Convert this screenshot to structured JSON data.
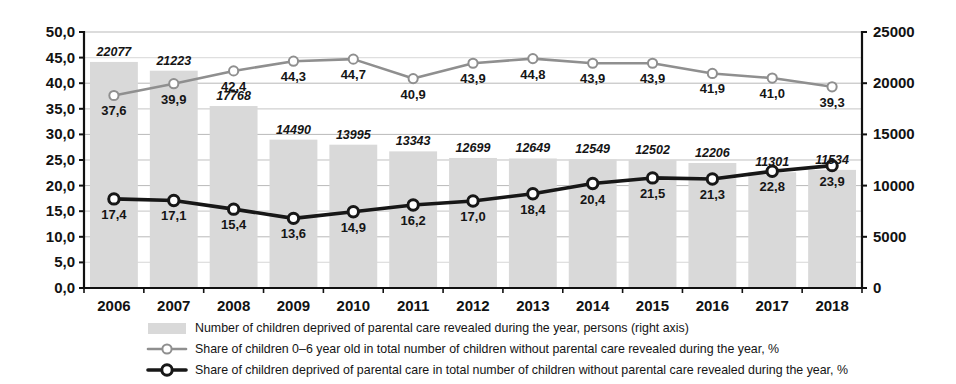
{
  "chart_data": {
    "type": "bar",
    "title": "",
    "subtitle": "",
    "xlabel": "",
    "ylabel": "",
    "grid": true,
    "legend_position": "bottom",
    "categories": [
      "2006",
      "2007",
      "2008",
      "2009",
      "2010",
      "2011",
      "2012",
      "2013",
      "2014",
      "2015",
      "2016",
      "2017",
      "2018"
    ],
    "axes": {
      "left": {
        "label": "",
        "min": 0,
        "max": 50,
        "step": 5,
        "ticks": [
          "0,0",
          "5,0",
          "10,0",
          "15,0",
          "20,0",
          "25,0",
          "30,0",
          "35,0",
          "40,0",
          "45,0",
          "50,0"
        ],
        "tick_values": [
          0,
          5,
          10,
          15,
          20,
          25,
          30,
          35,
          40,
          45,
          50
        ]
      },
      "right": {
        "label": "",
        "min": 0,
        "max": 25000,
        "step": 5000,
        "ticks": [
          "0",
          "5000",
          "10000",
          "15000",
          "20000",
          "25000"
        ],
        "tick_values": [
          0,
          5000,
          10000,
          15000,
          20000,
          25000
        ]
      }
    },
    "series": [
      {
        "name": "Number of children deprived of parental care revealed during the year, persons (right axis)",
        "type": "bar",
        "axis": "right",
        "color": "#d9d9d9",
        "values": [
          22077,
          21223,
          17768,
          14490,
          13995,
          13343,
          12699,
          12649,
          12549,
          12502,
          12206,
          11301,
          11534
        ],
        "labels": [
          "22077",
          "21223",
          "17768",
          "14490",
          "13995",
          "13343",
          "12699",
          "12649",
          "12549",
          "12502",
          "12206",
          "11301",
          "11534"
        ]
      },
      {
        "name": "Share of children 0–6 year old in total number of children without parental care revealed during the year, %",
        "type": "line",
        "axis": "left",
        "color": "#8f8f8f",
        "values": [
          37.6,
          39.9,
          42.4,
          44.3,
          44.7,
          40.9,
          43.9,
          44.8,
          43.9,
          43.9,
          41.9,
          41.0,
          39.3
        ],
        "labels": [
          "37,6",
          "39,9",
          "42,4",
          "44,3",
          "44,7",
          "40,9",
          "43,9",
          "44,8",
          "43,9",
          "43,9",
          "41,9",
          "41,0",
          "39,3"
        ],
        "label_pos": [
          "below",
          "below",
          "below",
          "below",
          "below",
          "below",
          "below",
          "below",
          "below",
          "below",
          "below",
          "below",
          "below"
        ]
      },
      {
        "name": "Share of children deprived of parental care in total number of children without parental care revealed during the year, %",
        "type": "line",
        "axis": "left",
        "color": "#171717",
        "values": [
          17.4,
          17.1,
          15.4,
          13.6,
          14.9,
          16.2,
          17.0,
          18.4,
          20.4,
          21.5,
          21.3,
          22.8,
          23.9
        ],
        "labels": [
          "17,4",
          "17,1",
          "15,4",
          "13,6",
          "14,9",
          "16,2",
          "17,0",
          "18,4",
          "20,4",
          "21,5",
          "21,3",
          "22,8",
          "23,9"
        ],
        "label_pos": [
          "below",
          "below",
          "below",
          "below",
          "below",
          "below",
          "below",
          "below",
          "below",
          "below",
          "below",
          "below",
          "below"
        ]
      }
    ],
    "legend": [
      {
        "marker": "swatch",
        "color": "#d9d9d9",
        "text": "Number of children deprived of parental care revealed during the year, persons (right axis)"
      },
      {
        "marker": "line-circle",
        "color": "#8f8f8f",
        "text": "Share of children 0–6 year old in total number of children without parental care revealed during the year, %"
      },
      {
        "marker": "line-circle-bold",
        "color": "#171717",
        "text": "Share of children deprived of parental care in total number of children without parental care revealed during the year, %"
      }
    ]
  }
}
